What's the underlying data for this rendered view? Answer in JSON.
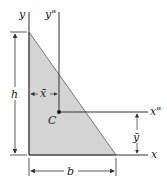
{
  "diagram": {
    "labels": {
      "y_axis": "y",
      "y_centroid_axis": "y\"",
      "x_axis": "x",
      "x_centroid_axis": "x\"",
      "centroid": "C",
      "height": "h",
      "base": "b",
      "x_bar": "x̄",
      "y_bar": "ȳ"
    },
    "colors": {
      "fill": "#d4d4d4",
      "line": "#333333"
    }
  }
}
